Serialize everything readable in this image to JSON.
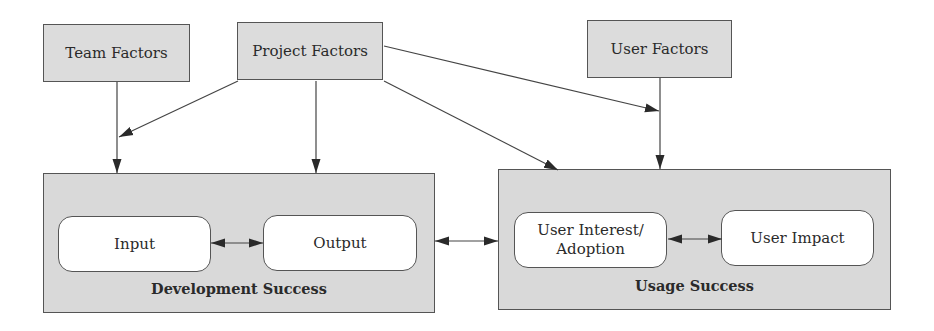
{
  "diagram": {
    "factors": {
      "team": {
        "label": "Team Factors"
      },
      "project": {
        "label": "Project Factors"
      },
      "user": {
        "label": "User Factors"
      }
    },
    "development": {
      "label": "Development Success",
      "input": {
        "label": "Input"
      },
      "output": {
        "label": "Output"
      }
    },
    "usage": {
      "label": "Usage Success",
      "interest": {
        "label": "User Interest/\nAdoption",
        "line1": "User Interest/",
        "line2": "Adoption"
      },
      "impact": {
        "label": "User Impact"
      }
    },
    "edges": [
      {
        "from": "Team Factors",
        "to": "Development Success",
        "type": "directed"
      },
      {
        "from": "Project Factors",
        "to": "Team Factors edge (Development Success)",
        "type": "directed"
      },
      {
        "from": "Project Factors",
        "to": "Development Success",
        "type": "directed"
      },
      {
        "from": "Project Factors",
        "to": "Usage Success",
        "type": "directed"
      },
      {
        "from": "Project Factors",
        "to": "User Factors edge (Usage Success)",
        "type": "directed"
      },
      {
        "from": "User Factors",
        "to": "Usage Success",
        "type": "directed"
      },
      {
        "from": "Input",
        "to": "Output",
        "type": "bidirectional"
      },
      {
        "from": "Development Success",
        "to": "Usage Success",
        "type": "bidirectional"
      },
      {
        "from": "User Interest/Adoption",
        "to": "User Impact",
        "type": "bidirectional"
      }
    ],
    "colors": {
      "box_fill": "#dcdcdc",
      "inner_fill": "#ffffff",
      "stroke": "#555555",
      "arrow": "#2a2a2a"
    }
  }
}
